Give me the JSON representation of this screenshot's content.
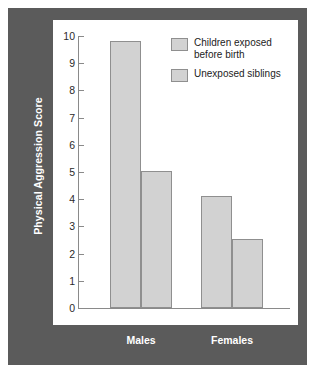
{
  "figure": {
    "frame_color": "#5b5b5b",
    "canvas_color": "#ffffff",
    "bar_fill": "#d2d2d2",
    "bar_edge": "#8f8f8f",
    "axis_color": "#8a8a8a",
    "label_color": "#ffffff"
  },
  "axis": {
    "ylabel": "Physical Aggression Score",
    "yticks": [
      "0",
      "1",
      "2",
      "3",
      "4",
      "5",
      "6",
      "7",
      "8",
      "9",
      "10"
    ]
  },
  "legend": {
    "items": [
      {
        "label": "Children exposed\nbefore birth",
        "swatch": "#d2d2d2"
      },
      {
        "label": "Unexposed siblings",
        "swatch": "#d2d2d2"
      }
    ]
  },
  "categories": [
    {
      "label": "Males"
    },
    {
      "label": "Females"
    }
  ],
  "chart_data": {
    "type": "bar",
    "title": "",
    "xlabel": "",
    "ylabel": "Physical Aggression Score",
    "categories": [
      "Males",
      "Females"
    ],
    "series": [
      {
        "name": "Children exposed before birth",
        "values": [
          9.8,
          4.1
        ]
      },
      {
        "name": "Unexposed siblings",
        "values": [
          5.05,
          2.55
        ]
      }
    ],
    "ylim": [
      0,
      10
    ],
    "ytick_step": 1,
    "grid": false,
    "legend_position": "top-right"
  }
}
